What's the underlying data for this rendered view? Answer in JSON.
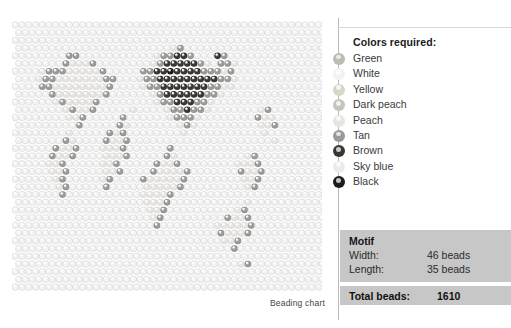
{
  "chart": {
    "caption": "Beading chart",
    "grid": {
      "columns": 46,
      "rows": 35,
      "bead_pitch_x": 6.74,
      "bead_pitch_y": 7.71,
      "bead_radius": 3.3,
      "offset_rows": true
    }
  },
  "legend": {
    "title": "Colors required:",
    "items": [
      {
        "label": "Green",
        "color": "#b9bdb4"
      },
      {
        "label": "White",
        "color": "#f2f2f2"
      },
      {
        "label": "Yellow",
        "color": "#d8d6c6"
      },
      {
        "label": "Dark peach",
        "color": "#c6c2bc"
      },
      {
        "label": "Peach",
        "color": "#e8e5e1"
      },
      {
        "label": "Tan",
        "color": "#9a9a98"
      },
      {
        "label": "Brown",
        "color": "#3a3733"
      },
      {
        "label": "Sky blue",
        "color": "#e9ecee"
      },
      {
        "label": "Black",
        "color": "#1c1c1c"
      }
    ]
  },
  "motif": {
    "heading": "Motif",
    "rows": [
      {
        "key": "Width:",
        "value": "46 beads"
      },
      {
        "key": "Length:",
        "value": "35 beads"
      }
    ],
    "total_label": "Total beads:",
    "total_value": "1610"
  },
  "chart_data": {
    "type": "heatmap",
    "title": "Beading chart",
    "palette_order": [
      "Green",
      "White",
      "Yellow",
      "Dark peach",
      "Peach",
      "Tan",
      "Brown",
      "Sky blue",
      "Black"
    ],
    "background_color_index": 1,
    "grid_width": 46,
    "grid_height": 35,
    "total_beads": 1610,
    "map_regions": [
      {
        "name": "North America",
        "cx": 0.22,
        "cy": 0.34
      },
      {
        "name": "South America",
        "cx": 0.3,
        "cy": 0.68
      },
      {
        "name": "Europe",
        "cx": 0.5,
        "cy": 0.28
      },
      {
        "name": "Africa",
        "cx": 0.52,
        "cy": 0.58
      },
      {
        "name": "Asia",
        "cx": 0.68,
        "cy": 0.32
      },
      {
        "name": "Australia",
        "cx": 0.82,
        "cy": 0.72
      }
    ]
  }
}
